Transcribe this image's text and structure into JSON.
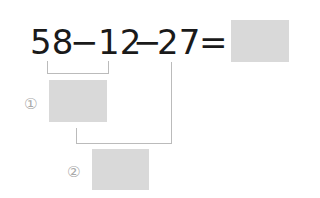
{
  "expression": {
    "n1": "58",
    "op1": "−",
    "n2": "12",
    "op2": "−",
    "n3": "27",
    "eq": "="
  },
  "steps": [
    {
      "label": "①",
      "value": ""
    },
    {
      "label": "②",
      "value": ""
    }
  ],
  "answer": "",
  "colors": {
    "box": "#d9d9d9",
    "line": "#bbbbbb",
    "text": "#1a1a1a",
    "label": "#aaaaaa"
  }
}
